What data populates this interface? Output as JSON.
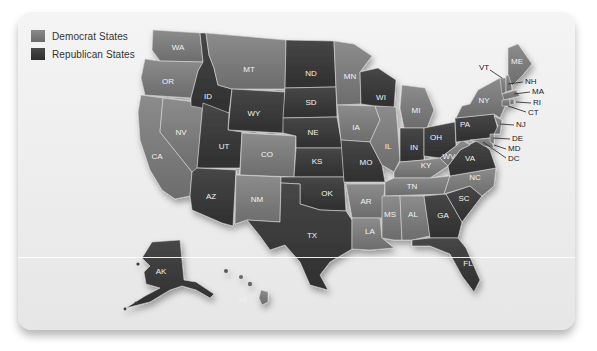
{
  "legend": {
    "items": [
      {
        "label": "Democrat States",
        "color": "#7a7a7a"
      },
      {
        "label": "Republican States",
        "color": "#3a3a3a"
      }
    ]
  },
  "colors": {
    "democrat": "#7c7c7c",
    "republican": "#3b3b3b",
    "card_bg": "#efefef"
  },
  "states": [
    {
      "abbr": "WA",
      "party": "democrat",
      "lx": 178,
      "ly": 48
    },
    {
      "abbr": "OR",
      "party": "democrat",
      "lx": 168,
      "ly": 82
    },
    {
      "abbr": "CA",
      "party": "democrat",
      "lx": 157,
      "ly": 157
    },
    {
      "abbr": "NV",
      "party": "democrat",
      "lx": 181,
      "ly": 133
    },
    {
      "abbr": "ID",
      "party": "republican",
      "lx": 208,
      "ly": 97
    },
    {
      "abbr": "MT",
      "party": "democrat",
      "lx": 249,
      "ly": 70
    },
    {
      "abbr": "WY",
      "party": "republican",
      "lx": 254,
      "ly": 114
    },
    {
      "abbr": "UT",
      "party": "republican",
      "lx": 224,
      "ly": 147
    },
    {
      "abbr": "CO",
      "party": "democrat",
      "lx": 267,
      "ly": 155
    },
    {
      "abbr": "AZ",
      "party": "republican",
      "lx": 211,
      "ly": 197
    },
    {
      "abbr": "NM",
      "party": "democrat",
      "lx": 257,
      "ly": 200
    },
    {
      "abbr": "ND",
      "party": "republican",
      "lx": 311,
      "ly": 74
    },
    {
      "abbr": "SD",
      "party": "republican",
      "lx": 311,
      "ly": 103
    },
    {
      "abbr": "NE",
      "party": "republican",
      "lx": 313,
      "ly": 133
    },
    {
      "abbr": "KS",
      "party": "republican",
      "lx": 317,
      "ly": 162
    },
    {
      "abbr": "OK",
      "party": "republican",
      "lx": 327,
      "ly": 194
    },
    {
      "abbr": "TX",
      "party": "republican",
      "lx": 312,
      "ly": 236
    },
    {
      "abbr": "MN",
      "party": "democrat",
      "lx": 350,
      "ly": 77
    },
    {
      "abbr": "IA",
      "party": "democrat",
      "lx": 356,
      "ly": 128
    },
    {
      "abbr": "MO",
      "party": "republican",
      "lx": 366,
      "ly": 163
    },
    {
      "abbr": "AR",
      "party": "democrat",
      "lx": 366,
      "ly": 202
    },
    {
      "abbr": "LA",
      "party": "democrat",
      "lx": 370,
      "ly": 232
    },
    {
      "abbr": "WI",
      "party": "republican",
      "lx": 381,
      "ly": 98
    },
    {
      "abbr": "IL",
      "party": "democrat",
      "lx": 388,
      "ly": 147
    },
    {
      "abbr": "MI",
      "party": "democrat",
      "lx": 416,
      "ly": 111
    },
    {
      "abbr": "IN",
      "party": "republican",
      "lx": 414,
      "ly": 148
    },
    {
      "abbr": "OH",
      "party": "republican",
      "lx": 436,
      "ly": 138
    },
    {
      "abbr": "KY",
      "party": "democrat",
      "lx": 426,
      "ly": 166
    },
    {
      "abbr": "TN",
      "party": "democrat",
      "lx": 412,
      "ly": 187
    },
    {
      "abbr": "MS",
      "party": "democrat",
      "lx": 390,
      "ly": 215
    },
    {
      "abbr": "AL",
      "party": "democrat",
      "lx": 413,
      "ly": 215
    },
    {
      "abbr": "GA",
      "party": "republican",
      "lx": 443,
      "ly": 216
    },
    {
      "abbr": "FL",
      "party": "republican",
      "lx": 468,
      "ly": 264
    },
    {
      "abbr": "SC",
      "party": "republican",
      "lx": 464,
      "ly": 199
    },
    {
      "abbr": "NC",
      "party": "democrat",
      "lx": 475,
      "ly": 178
    },
    {
      "abbr": "VA",
      "party": "republican",
      "lx": 470,
      "ly": 159
    },
    {
      "abbr": "WV",
      "party": "democrat",
      "lx": 449,
      "ly": 157
    },
    {
      "abbr": "PA",
      "party": "republican",
      "lx": 465,
      "ly": 125
    },
    {
      "abbr": "NY",
      "party": "democrat",
      "lx": 484,
      "ly": 101
    },
    {
      "abbr": "ME",
      "party": "democrat",
      "lx": 517,
      "ly": 62
    },
    {
      "abbr": "AK",
      "party": "republican",
      "lx": 161,
      "ly": 272
    },
    {
      "abbr": "HI",
      "party": "democrat",
      "lx": 243,
      "ly": 300
    }
  ],
  "callouts": [
    {
      "abbr": "VT",
      "tx": 479,
      "ty": 68,
      "x1": 490,
      "y1": 70,
      "x2": 502,
      "y2": 78
    },
    {
      "abbr": "NH",
      "tx": 525,
      "ty": 82,
      "x1": 523,
      "y1": 82,
      "x2": 508,
      "y2": 84
    },
    {
      "abbr": "MA",
      "tx": 532,
      "ty": 92,
      "x1": 530,
      "y1": 92,
      "x2": 514,
      "y2": 94
    },
    {
      "abbr": "RI",
      "tx": 533,
      "ty": 103,
      "x1": 531,
      "y1": 103,
      "x2": 516,
      "y2": 102
    },
    {
      "abbr": "CT",
      "tx": 528,
      "ty": 113,
      "x1": 526,
      "y1": 112,
      "x2": 508,
      "y2": 106
    },
    {
      "abbr": "NJ",
      "tx": 516,
      "ty": 125,
      "x1": 514,
      "y1": 125,
      "x2": 500,
      "y2": 124
    },
    {
      "abbr": "DE",
      "tx": 512,
      "ty": 139,
      "x1": 510,
      "y1": 139,
      "x2": 493,
      "y2": 138
    },
    {
      "abbr": "MD",
      "tx": 508,
      "ty": 149,
      "x1": 506,
      "y1": 149,
      "x2": 494,
      "y2": 145
    },
    {
      "abbr": "DC",
      "tx": 508,
      "ty": 159,
      "x1": 506,
      "y1": 158,
      "x2": 483,
      "y2": 142
    }
  ]
}
